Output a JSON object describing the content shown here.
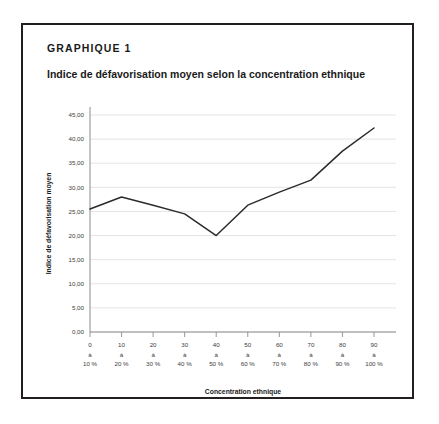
{
  "figure": {
    "label": "GRAPHIQUE 1",
    "title": "Indice de défavorisation moyen selon la concentration ethnique"
  },
  "chart_data": {
    "type": "line",
    "title": "Indice de défavorisation moyen selon la concentration ethnique",
    "xlabel": "Concentration ethnique",
    "ylabel": "Indice de défavorisation moyen",
    "categories": [
      "0 à 10 %",
      "10 à 20 %",
      "20 à 30 %",
      "30 à 40 %",
      "40 à 50 %",
      "50 à 60 %",
      "60 à 70 %",
      "70 à 80 %",
      "80 à 90 %",
      "90 à 100 %"
    ],
    "category_lines": [
      [
        "0",
        "à",
        "10 %"
      ],
      [
        "10",
        "à",
        "20 %"
      ],
      [
        "20",
        "à",
        "30 %"
      ],
      [
        "30",
        "à",
        "40 %"
      ],
      [
        "40",
        "à",
        "50 %"
      ],
      [
        "50",
        "à",
        "60 %"
      ],
      [
        "60",
        "à",
        "70 %"
      ],
      [
        "70",
        "à",
        "80 %"
      ],
      [
        "80",
        "à",
        "90 %"
      ],
      [
        "90",
        "à",
        "100 %"
      ]
    ],
    "values": [
      25.5,
      28.0,
      26.3,
      24.5,
      20.0,
      26.3,
      29.0,
      31.5,
      37.5,
      42.3
    ],
    "ylim": [
      0,
      45
    ],
    "ytick_values": [
      0,
      5,
      10,
      15,
      20,
      25,
      30,
      35,
      40,
      45
    ],
    "ytick_labels": [
      "0,00",
      "5,00",
      "10,00",
      "15,00",
      "20,00",
      "25,00",
      "30,00",
      "35,00",
      "40,00",
      "45,00"
    ],
    "grid": true,
    "legend": false,
    "line_color": "#2b2b2b",
    "grid_color": "#d9d9d9"
  }
}
